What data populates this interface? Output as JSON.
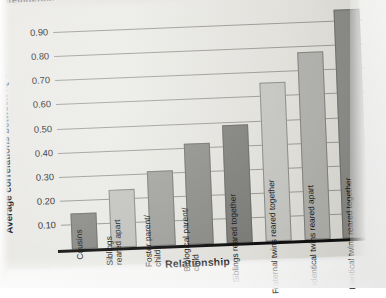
{
  "page": {
    "cut_header_text": "ntelligence",
    "background_color": "#e9e8e4"
  },
  "chart_data": {
    "type": "bar",
    "title": "",
    "xlabel": "Relationship",
    "ylabel": "Average correlations between IQ scores",
    "ylim": [
      0.0,
      1.0
    ],
    "grid": true,
    "legend": "none",
    "ytick_labels": [
      "0.90",
      "0.80",
      "0.70",
      "0.60",
      "0.50",
      "0.40",
      "0.30",
      "0.20",
      "0.10",
      "0.00"
    ],
    "ytick_values": [
      0.9,
      0.8,
      0.7,
      0.6,
      0.5,
      0.4,
      0.3,
      0.2,
      0.1,
      0.0
    ],
    "categories": [
      "Cousins",
      "Siblings\nreared apart",
      "Foster parent/\nchild",
      "Biological parent/\nchild",
      "Siblings reared together",
      "Fraternal twins reared together",
      "Identical twins reared apart",
      "Identical twins reared together"
    ],
    "values": [
      0.15,
      0.24,
      0.31,
      0.42,
      0.49,
      0.66,
      0.78,
      0.95
    ],
    "bar_colors": [
      "#8a8a87",
      "#c6c6c2",
      "#a3a3a0",
      "#8e8e8b",
      "#7f7f7c",
      "#c9c9c5",
      "#b2b2ae",
      "#8b8b88"
    ]
  }
}
